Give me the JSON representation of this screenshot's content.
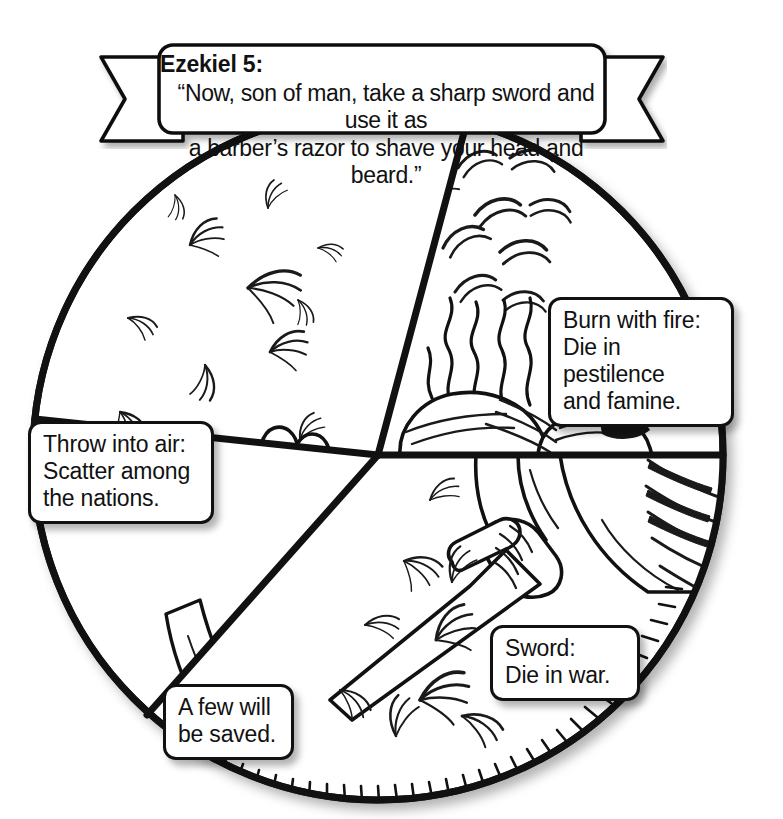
{
  "page": {
    "background_color": "#ffffff",
    "ink_color": "#111111",
    "width": 783,
    "height": 819
  },
  "banner": {
    "name": "ezekiel-banner",
    "title": "Ezekiel 5:",
    "quote": "“Now, son of man, take a sharp sword and use it as\na barber’s razor to shave your head and beard.”"
  },
  "diagram": {
    "type": "pie",
    "center": [
      378,
      455
    ],
    "radius": 345,
    "sectors": [
      {
        "id": "scatter",
        "label": "Throw into air:\nScatter among\nthe nations.",
        "imagery": "hair blowing in the wind above an open hand",
        "start_angle_deg": 186,
        "end_angle_deg": 285
      },
      {
        "id": "burn",
        "label": "Burn with fire:\nDie in pestilence\nand famine.",
        "imagery": "flames and smoke rising from burning hair",
        "start_angle_deg": 285,
        "end_angle_deg": 360
      },
      {
        "id": "sword",
        "label": "Sword:\nDie in war.",
        "imagery": "hand gripping a sword among falling hair",
        "start_angle_deg": 0,
        "end_angle_deg": 132
      },
      {
        "id": "remnant",
        "label": "A few will\nbe saved.",
        "imagery": "narrow sliver of the circle",
        "start_angle_deg": 132,
        "end_angle_deg": 186
      }
    ]
  },
  "callouts": {
    "burn": "Burn with fire:\nDie in pestilence\nand famine.",
    "throw": "Throw into air:\nScatter among\nthe nations.",
    "saved": "A few will\nbe saved.",
    "sword": "Sword:\nDie in war."
  }
}
